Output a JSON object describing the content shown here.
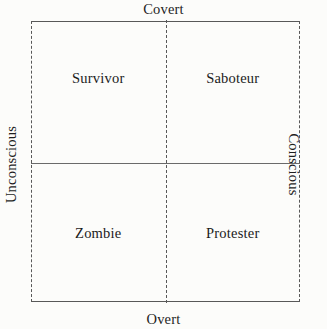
{
  "figure": {
    "type": "2x2-matrix-diagram",
    "background_color": "#fcfcfa",
    "line_color": "#585858",
    "text_color": "#1b1b1b"
  },
  "axes": {
    "top_label": "Covert",
    "bottom_label": "Overt",
    "left_label": "Unconscious",
    "right_label": "Conscious"
  },
  "quadrants": [
    {
      "position": "top-left",
      "label": "Survivor"
    },
    {
      "position": "top-right",
      "label": "Saboteur"
    },
    {
      "position": "bottom-left",
      "label": "Zombie"
    },
    {
      "position": "bottom-right",
      "label": "Protester"
    }
  ]
}
